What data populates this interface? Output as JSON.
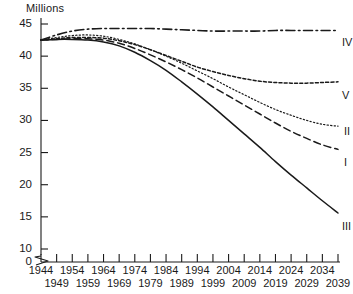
{
  "axis": {
    "y_title": "Millions",
    "y_ticks": [
      45,
      40,
      35,
      30,
      25,
      20,
      15,
      10,
      0
    ],
    "y_break_between": [
      0,
      10
    ],
    "x_ticks_top": [
      1944,
      1954,
      1964,
      1974,
      1984,
      1994,
      2004,
      2014,
      2024,
      2034
    ],
    "x_ticks_bottom": [
      1949,
      1959,
      1969,
      1979,
      1989,
      1999,
      2009,
      2019,
      2029,
      2039
    ]
  },
  "series_labels": {
    "I": "I",
    "II": "II",
    "III": "III",
    "IV": "IV",
    "V": "V"
  },
  "chart_data": {
    "type": "line",
    "title": "",
    "xlabel": "",
    "ylabel": "Millions",
    "xlim": [
      1944,
      2039
    ],
    "ylim": [
      10,
      45
    ],
    "y_axis_break": true,
    "grid": false,
    "legend": "inline-right-end-labels",
    "x": [
      1944,
      1949,
      1954,
      1959,
      1964,
      1969,
      1974,
      1979,
      1984,
      1989,
      1994,
      1999,
      2004,
      2009,
      2014,
      2019,
      2024,
      2029,
      2034,
      2039
    ],
    "series": [
      {
        "name": "IV",
        "label": "IV",
        "dash": "dash-dot",
        "color": "#1a1a1a",
        "values": [
          42.5,
          43.3,
          43.9,
          44.2,
          44.3,
          44.3,
          44.3,
          44.3,
          44.2,
          44.1,
          44.0,
          43.9,
          43.9,
          43.9,
          43.9,
          44.0,
          44.0,
          44.0,
          44.0,
          44.0
        ]
      },
      {
        "name": "V",
        "label": "V",
        "dash": "dashed-fine",
        "color": "#1a1a1a",
        "values": [
          42.5,
          42.7,
          42.9,
          42.9,
          42.8,
          42.4,
          41.8,
          41.0,
          40.1,
          39.2,
          38.3,
          37.6,
          37.0,
          36.5,
          36.1,
          35.9,
          35.8,
          35.8,
          35.9,
          36.0
        ]
      },
      {
        "name": "II",
        "label": "II",
        "dash": "dotted",
        "color": "#1a1a1a",
        "values": [
          42.5,
          42.9,
          43.2,
          43.3,
          43.1,
          42.6,
          41.9,
          41.0,
          40.0,
          38.9,
          37.7,
          36.5,
          35.2,
          34.0,
          32.8,
          31.7,
          30.8,
          30.0,
          29.4,
          29.1
        ]
      },
      {
        "name": "I",
        "label": "I",
        "dash": "dashed",
        "color": "#1a1a1a",
        "values": [
          42.5,
          42.6,
          42.7,
          42.7,
          42.5,
          42.0,
          41.2,
          40.2,
          39.1,
          37.9,
          36.6,
          35.2,
          33.8,
          32.4,
          31.0,
          29.6,
          28.3,
          27.2,
          26.2,
          25.5
        ]
      },
      {
        "name": "III",
        "label": "III",
        "dash": "solid",
        "color": "#1a1a1a",
        "values": [
          42.5,
          42.6,
          42.6,
          42.5,
          42.2,
          41.6,
          40.6,
          39.3,
          37.8,
          36.0,
          34.1,
          32.1,
          30.0,
          27.9,
          25.8,
          23.6,
          21.5,
          19.5,
          17.5,
          15.6
        ]
      }
    ]
  }
}
